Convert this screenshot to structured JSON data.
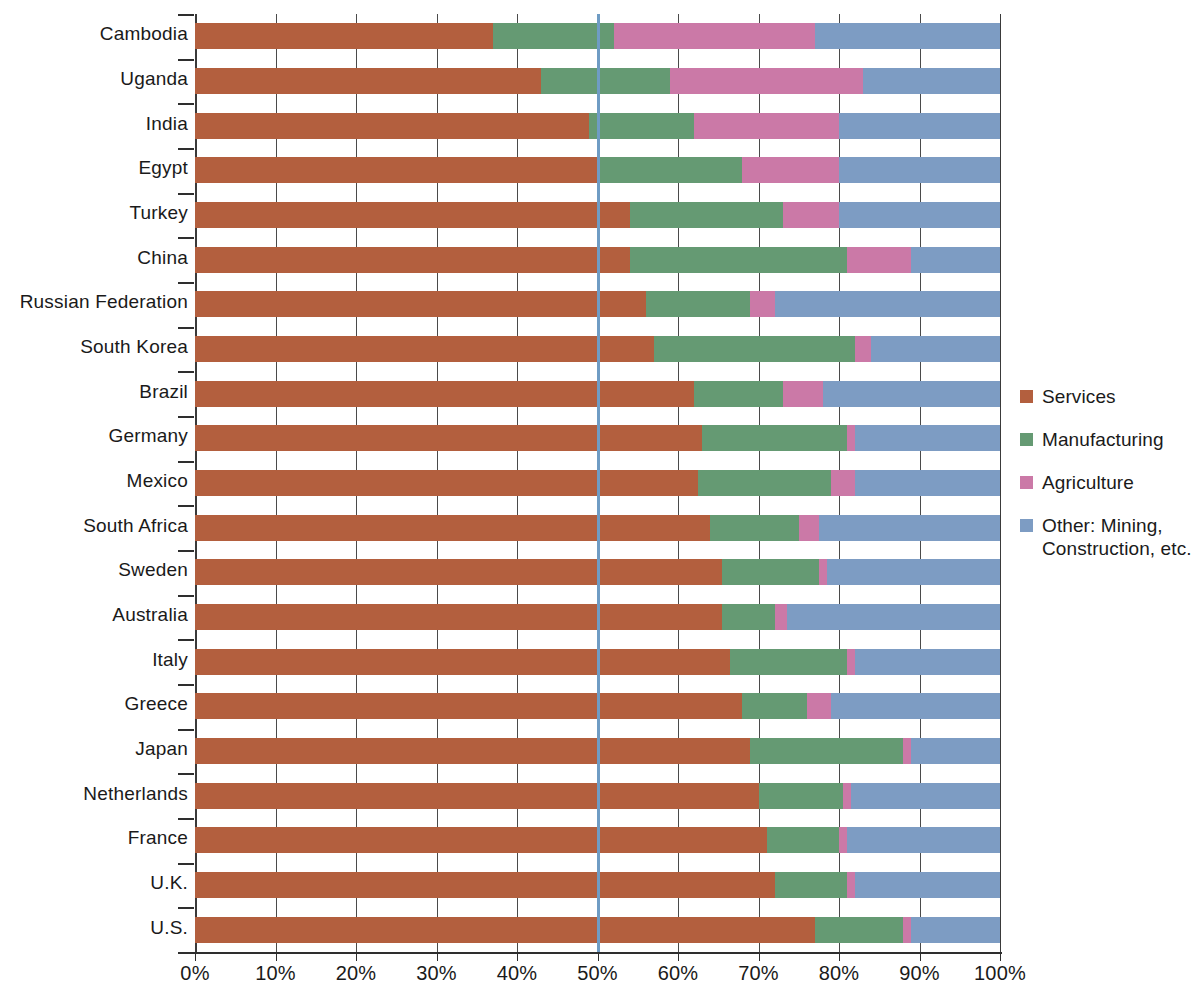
{
  "chart_data": {
    "type": "bar",
    "orientation": "horizontal",
    "stacked": true,
    "normalized_percent": true,
    "title": "",
    "subtitle": "",
    "xlabel": "",
    "ylabel": "",
    "xlim": [
      0,
      100
    ],
    "grid": true,
    "legend_position": "right",
    "reference_line": {
      "value": 50,
      "label": "50%",
      "color": "#6f9cc4"
    },
    "xticks": [
      0,
      10,
      20,
      30,
      40,
      50,
      60,
      70,
      80,
      90,
      100
    ],
    "xtick_labels": [
      "0%",
      "10%",
      "20%",
      "30%",
      "40%",
      "50%",
      "60%",
      "70%",
      "80%",
      "90%",
      "100%"
    ],
    "categories": [
      "Cambodia",
      "Uganda",
      "India",
      "Egypt",
      "Turkey",
      "China",
      "Russian Federation",
      "South Korea",
      "Brazil",
      "Germany",
      "Mexico",
      "South Africa",
      "Sweden",
      "Australia",
      "Italy",
      "Greece",
      "Japan",
      "Netherlands",
      "France",
      "U.K.",
      "U.S."
    ],
    "series": [
      {
        "name": "Services",
        "color": "#b35f3e",
        "values": [
          37,
          43,
          49,
          50,
          54,
          54,
          56,
          57,
          62,
          63,
          62.5,
          64,
          65.5,
          65.5,
          66.5,
          68,
          69,
          70,
          71,
          72,
          77
        ]
      },
      {
        "name": "Manufacturing",
        "color": "#659a73",
        "values": [
          15,
          16,
          13,
          18,
          19,
          27,
          13,
          25,
          11,
          18,
          16.5,
          11,
          12,
          6.5,
          14.5,
          8,
          19,
          10.5,
          9,
          9,
          11
        ]
      },
      {
        "name": "Agriculture",
        "color": "#cb79a7",
        "values": [
          25,
          24,
          18,
          12,
          7,
          8,
          3,
          2,
          5,
          1,
          3,
          2.5,
          1,
          1.5,
          1,
          3,
          1,
          1,
          1,
          1,
          1
        ]
      },
      {
        "name": "Other: Mining, Construction, etc.",
        "color": "#7d9cc3",
        "values": [
          23,
          17,
          20,
          20,
          20,
          11,
          28,
          16,
          22,
          18,
          18,
          22.5,
          21.5,
          26.5,
          18,
          21,
          11,
          18.5,
          19,
          18,
          11
        ]
      }
    ]
  },
  "legend": {
    "items": [
      {
        "label": "Services",
        "color": "#b35f3e"
      },
      {
        "label": "Manufacturing",
        "color": "#659a73"
      },
      {
        "label": "Agriculture",
        "color": "#cb79a7"
      },
      {
        "label": "Other: Mining,\nConstruction, etc.",
        "color": "#7d9cc3"
      }
    ]
  }
}
